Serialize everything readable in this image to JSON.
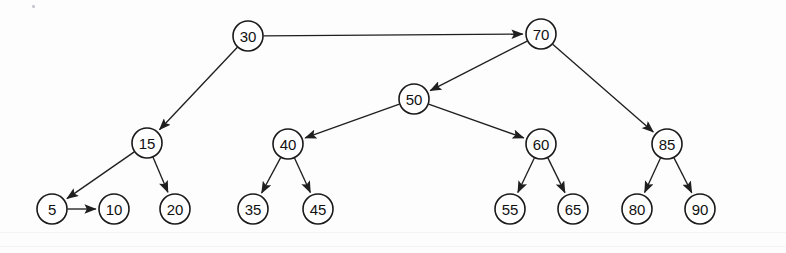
{
  "figure": {
    "kind": "binary-search-tree-diagram",
    "background_color": "#fdfdfd",
    "node_fill": "#ffffff",
    "node_stroke": "#1a1a1a",
    "edge_color": "#1f1f1f",
    "text_color": "#111111",
    "node_radius": 15,
    "canvas": {
      "width": 786,
      "height": 253
    }
  },
  "nodes": [
    {
      "id": "n30",
      "label": "30",
      "x": 248,
      "y": 36,
      "level": 0
    },
    {
      "id": "n70",
      "label": "70",
      "x": 541,
      "y": 34,
      "level": 0
    },
    {
      "id": "n50",
      "label": "50",
      "x": 414,
      "y": 99,
      "level": 1
    },
    {
      "id": "n15",
      "label": "15",
      "x": 147,
      "y": 143,
      "level": 2
    },
    {
      "id": "n40",
      "label": "40",
      "x": 288,
      "y": 144,
      "level": 2
    },
    {
      "id": "n60",
      "label": "60",
      "x": 541,
      "y": 144,
      "level": 2
    },
    {
      "id": "n85",
      "label": "85",
      "x": 667,
      "y": 144,
      "level": 2
    },
    {
      "id": "n5",
      "label": "5",
      "x": 52,
      "y": 209,
      "level": 3
    },
    {
      "id": "n10",
      "label": "10",
      "x": 114,
      "y": 209,
      "level": 3
    },
    {
      "id": "n20",
      "label": "20",
      "x": 175,
      "y": 209,
      "level": 3
    },
    {
      "id": "n35",
      "label": "35",
      "x": 253,
      "y": 209,
      "level": 3
    },
    {
      "id": "n45",
      "label": "45",
      "x": 318,
      "y": 209,
      "level": 3
    },
    {
      "id": "n55",
      "label": "55",
      "x": 510,
      "y": 209,
      "level": 3
    },
    {
      "id": "n65",
      "label": "65",
      "x": 573,
      "y": 209,
      "level": 3
    },
    {
      "id": "n80",
      "label": "80",
      "x": 637,
      "y": 209,
      "level": 3
    },
    {
      "id": "n90",
      "label": "90",
      "x": 700,
      "y": 209,
      "level": 3
    }
  ],
  "edges": [
    {
      "id": "e30-70",
      "from": "n30",
      "to": "n70",
      "arrow": true,
      "relation": "right-child"
    },
    {
      "id": "e30-15",
      "from": "n30",
      "to": "n15",
      "arrow": true,
      "relation": "left-child"
    },
    {
      "id": "e70-50",
      "from": "n70",
      "to": "n50",
      "arrow": true,
      "relation": "left-child"
    },
    {
      "id": "e70-85",
      "from": "n70",
      "to": "n85",
      "arrow": true,
      "relation": "right-child"
    },
    {
      "id": "e50-40",
      "from": "n50",
      "to": "n40",
      "arrow": true,
      "relation": "left-child"
    },
    {
      "id": "e50-60",
      "from": "n50",
      "to": "n60",
      "arrow": true,
      "relation": "right-child"
    },
    {
      "id": "e15-5",
      "from": "n15",
      "to": "n5",
      "arrow": true,
      "relation": "left-child"
    },
    {
      "id": "e15-20",
      "from": "n15",
      "to": "n20",
      "arrow": true,
      "relation": "right-child"
    },
    {
      "id": "e5-10",
      "from": "n5",
      "to": "n10",
      "arrow": true,
      "relation": "right-child"
    },
    {
      "id": "e40-35",
      "from": "n40",
      "to": "n35",
      "arrow": true,
      "relation": "left-child"
    },
    {
      "id": "e40-45",
      "from": "n40",
      "to": "n45",
      "arrow": true,
      "relation": "right-child"
    },
    {
      "id": "e60-55",
      "from": "n60",
      "to": "n55",
      "arrow": true,
      "relation": "left-child"
    },
    {
      "id": "e60-65",
      "from": "n60",
      "to": "n65",
      "arrow": true,
      "relation": "right-child"
    },
    {
      "id": "e85-80",
      "from": "n85",
      "to": "n80",
      "arrow": true,
      "relation": "left-child"
    },
    {
      "id": "e85-90",
      "from": "n85",
      "to": "n90",
      "arrow": true,
      "relation": "right-child"
    }
  ],
  "artifacts": {
    "specks": [
      {
        "x": 32,
        "y": 5
      }
    ],
    "bands": [
      {
        "y": 232
      },
      {
        "y": 246
      }
    ]
  }
}
